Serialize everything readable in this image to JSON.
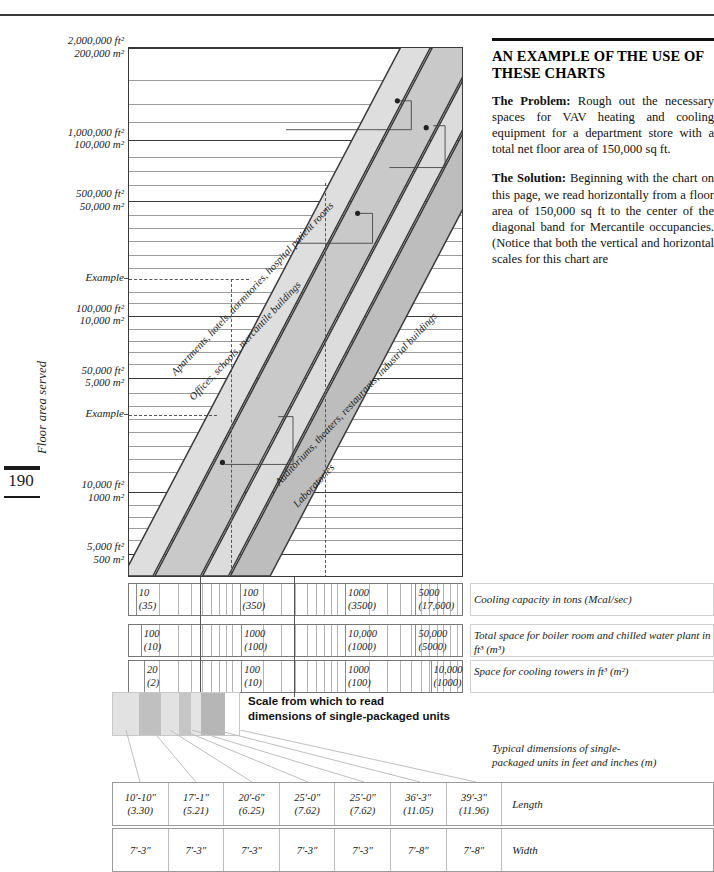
{
  "page": {
    "number": "190",
    "cut_header": "",
    "y_axis_title": "Floor area served"
  },
  "chart_data": {
    "type": "line",
    "ylabel": "Floor area served",
    "grid": true,
    "scale": "log-log",
    "y_ticks": [
      {
        "ft": "2,000,000 ft²",
        "m": "200,000 m²",
        "pos": 0.0
      },
      {
        "ft": "1,000,000 ft²",
        "m": "100,000 m²",
        "pos": 0.173
      },
      {
        "ft": "500,000 ft²",
        "m": "50,000 m²",
        "pos": 0.289
      },
      {
        "ft": "100,000 ft²",
        "m": "10,000 m²",
        "pos": 0.505
      },
      {
        "ft": "50,000 ft²",
        "m": "5,000 m²",
        "pos": 0.622
      },
      {
        "ft": "10,000 ft²",
        "m": "1000 m²",
        "pos": 0.838
      },
      {
        "ft": "5,000 ft²",
        "m": "500 m²",
        "pos": 0.955
      }
    ],
    "y_example_labels": [
      {
        "label": "Example",
        "pos": 0.435
      },
      {
        "label": "Example",
        "pos": 0.693
      }
    ],
    "bands": [
      {
        "name": "Apartments, hotels, dormitories, hospital patient rooms",
        "fill": "#d8d8d8"
      },
      {
        "name": "Offices, schools, mercantile buildings",
        "fill": "#c2c2c2"
      },
      {
        "name": "Auditoriums, theaters, restaurants, industrial buildings",
        "fill": "#b0b0b0"
      },
      {
        "name": "Laboratories",
        "fill": "#cacaca"
      }
    ],
    "scales": [
      {
        "caption": "Cooling capacity in tons (Mcal/sec)",
        "ticks": [
          {
            "top": "10",
            "bot": "(35)",
            "pos": 0.02
          },
          {
            "top": "100",
            "bot": "(350)",
            "pos": 0.33
          },
          {
            "top": "1000",
            "bot": "(3500)",
            "pos": 0.645
          },
          {
            "top": "5000",
            "bot": "(17,600)",
            "pos": 0.855
          }
        ]
      },
      {
        "caption": "Total space for boiler room and chilled water plant in ft³ (m³)",
        "ticks": [
          {
            "top": "100",
            "bot": "(10)",
            "pos": 0.035
          },
          {
            "top": "1000",
            "bot": "(100)",
            "pos": 0.335
          },
          {
            "top": "10,000",
            "bot": "(1000)",
            "pos": 0.645
          },
          {
            "top": "50,000",
            "bot": "(5000)",
            "pos": 0.855
          }
        ]
      },
      {
        "caption": "Space for cooling towers in ft³ (m²)",
        "ticks": [
          {
            "top": "20",
            "bot": "(2)",
            "pos": 0.045
          },
          {
            "top": "100",
            "bot": "(10)",
            "pos": 0.335
          },
          {
            "top": "1000",
            "bot": "(100)",
            "pos": 0.645
          },
          {
            "top": "10,000",
            "bot": "(1000)",
            "pos": 0.9
          }
        ]
      }
    ]
  },
  "swatch": {
    "caption_line1": "Scale from which to read",
    "caption_line2": "dimensions of single-packaged units",
    "colors": [
      "#e2e2e2",
      "#c0c0c0",
      "#e2e2e2",
      "#c6c6c6",
      "#e4e4e4",
      "#b6b6b6"
    ],
    "widths": [
      26,
      22,
      18,
      12,
      10,
      24
    ]
  },
  "dimensions_table": {
    "caption_line1": "Typical dimensions of single-",
    "caption_line2": "packaged units in feet and inches (m)",
    "rows": [
      {
        "label": "Length",
        "cells": [
          {
            "imperial": "10'-10″",
            "metric": "(3.30)"
          },
          {
            "imperial": "17'-1″",
            "metric": "(5.21)"
          },
          {
            "imperial": "20'-6″",
            "metric": "(6.25)"
          },
          {
            "imperial": "25'-0″",
            "metric": "(7.62)"
          },
          {
            "imperial": "25'-0″",
            "metric": "(7.62)"
          },
          {
            "imperial": "36'-3″",
            "metric": "(11.05)"
          },
          {
            "imperial": "39'-3″",
            "metric": "(11.96)"
          }
        ]
      },
      {
        "label": "Width",
        "cells": [
          {
            "imperial": "7'-3″",
            "metric": ""
          },
          {
            "imperial": "7'-3″",
            "metric": ""
          },
          {
            "imperial": "7'-3″",
            "metric": ""
          },
          {
            "imperial": "7'-3″",
            "metric": ""
          },
          {
            "imperial": "7'-3″",
            "metric": ""
          },
          {
            "imperial": "7'-8″",
            "metric": ""
          },
          {
            "imperial": "7'-8″",
            "metric": ""
          }
        ]
      }
    ]
  },
  "sidebar": {
    "heading": "AN EXAMPLE OF THE USE OF THESE CHARTS",
    "paragraphs": [
      {
        "lead": "The Problem:",
        "body": " Rough out the necessary spaces for VAV heating and cooling equipment for a department store with a total net floor area of 150,000 sq ft."
      },
      {
        "lead": "The Solution:",
        "body": " Beginning with the chart on this page, we read horizontally from a floor area of 150,000 sq ft to the center of the diagonal band for Mercantile occupancies. (Notice that both the vertical and horizontal scales for this chart are"
      }
    ]
  }
}
